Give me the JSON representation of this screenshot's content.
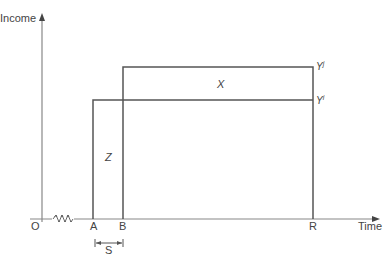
{
  "axes": {
    "y_label": "Income",
    "x_label": "Time",
    "origin_label": "O"
  },
  "points": {
    "a": "A",
    "b": "B",
    "r": "R"
  },
  "levels": {
    "upper": {
      "base": "Y",
      "sup": "j"
    },
    "lower": {
      "base": "Y",
      "sup": "i"
    }
  },
  "regions": {
    "x": "X",
    "z": "Z"
  },
  "interval": {
    "s": "S"
  },
  "colors": {
    "line": "#555555",
    "axis": "#777777",
    "text": "#444444"
  }
}
